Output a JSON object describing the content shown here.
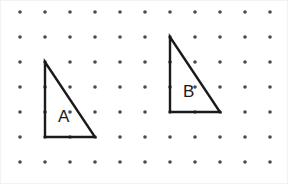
{
  "figure": {
    "width": 288,
    "height": 184,
    "background_color": "#ffffff",
    "border_color": "#f2f2f2"
  },
  "grid": {
    "name": "dot-grid",
    "columns": 11,
    "rows": 7,
    "origin_x": 19,
    "origin_y": 11,
    "spacing": 25,
    "dot_radius": 1.8,
    "dot_color": "#4a4a4a"
  },
  "shapes": [
    {
      "id": "triangle-a",
      "label": "A",
      "type": "right-triangle",
      "stroke_color": "#1a1a1a",
      "stroke_width": 2.4,
      "fill": "none",
      "vertices": [
        {
          "x": 44,
          "y": 61
        },
        {
          "x": 44,
          "y": 136
        },
        {
          "x": 94,
          "y": 136
        }
      ],
      "grid_vertices": [
        {
          "col": 1,
          "row": 2
        },
        {
          "col": 1,
          "row": 5
        },
        {
          "col": 3,
          "row": 5
        }
      ],
      "legs": {
        "base_units": 2,
        "height_units": 3
      },
      "label_position": {
        "x": 57,
        "y": 121
      }
    },
    {
      "id": "triangle-b",
      "label": "B",
      "type": "right-triangle",
      "stroke_color": "#1a1a1a",
      "stroke_width": 2.4,
      "fill": "none",
      "vertices": [
        {
          "x": 169,
          "y": 36
        },
        {
          "x": 169,
          "y": 111
        },
        {
          "x": 219,
          "y": 111
        }
      ],
      "grid_vertices": [
        {
          "col": 6,
          "row": 1
        },
        {
          "col": 6,
          "row": 4
        },
        {
          "col": 8,
          "row": 4
        }
      ],
      "legs": {
        "base_units": 2,
        "height_units": 3
      },
      "label_position": {
        "x": 182,
        "y": 96
      }
    }
  ]
}
